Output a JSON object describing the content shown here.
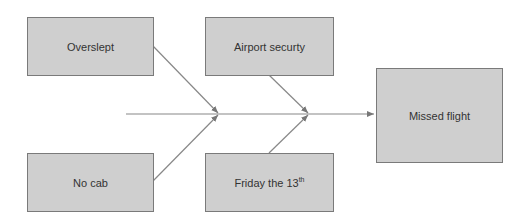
{
  "diagram": {
    "type": "fishbone",
    "causes": [
      {
        "label": "Overslept"
      },
      {
        "label": "Airport securty"
      },
      {
        "label": "No cab"
      },
      {
        "label": "Friday the 13",
        "superscript": "th"
      }
    ],
    "effect": {
      "label": "Missed flight"
    }
  },
  "colors": {
    "box_fill": "#cfcfcf",
    "box_border": "#7a7a7a",
    "line": "#808080"
  }
}
